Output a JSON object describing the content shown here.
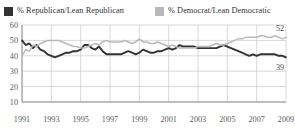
{
  "legend": {
    "position": "top",
    "entries": [
      {
        "key": "republican",
        "label": "% Republican/Lean Republican",
        "color": "#333333"
      },
      {
        "key": "democratic",
        "label": "% Democrat/Lean Democratic",
        "color": "#b9b9b9"
      }
    ]
  },
  "axis": {
    "y_ticks": [
      "60",
      "50",
      "40",
      "30",
      "20",
      "10"
    ],
    "x_ticks": [
      "1991",
      "1993",
      "1995",
      "1997",
      "1999",
      "2001",
      "2003",
      "2005",
      "2007",
      "2009"
    ]
  },
  "end_labels": {
    "democratic": "52",
    "republican": "39"
  },
  "chart_data": {
    "type": "line",
    "title": "",
    "subtitle": "",
    "xlabel": "",
    "ylabel": "",
    "xlim": [
      1991,
      2009
    ],
    "ylim": [
      10,
      60
    ],
    "yticks": [
      10,
      20,
      30,
      40,
      50,
      60
    ],
    "xticks": [
      1991,
      1993,
      1995,
      1997,
      1999,
      2001,
      2003,
      2005,
      2007,
      2009
    ],
    "grid": true,
    "legend_position": "top",
    "annotations": [
      {
        "series": "% Democrat/Lean Democratic",
        "x": 2009,
        "y": 52,
        "text": "52"
      },
      {
        "series": "% Republican/Lean Republican",
        "x": 2009,
        "y": 39,
        "text": "39"
      }
    ],
    "x": [
      1991,
      1991.25,
      1991.5,
      1991.75,
      1992,
      1992.25,
      1992.5,
      1992.75,
      1993,
      1993.25,
      1993.5,
      1993.75,
      1994,
      1994.25,
      1994.5,
      1994.75,
      1995,
      1995.25,
      1995.5,
      1995.75,
      1996,
      1996.25,
      1996.5,
      1996.75,
      1997,
      1997.25,
      1997.5,
      1997.75,
      1998,
      1998.25,
      1998.5,
      1998.75,
      1999,
      1999.25,
      1999.5,
      1999.75,
      2000,
      2000.25,
      2000.5,
      2000.75,
      2001,
      2001.25,
      2001.5,
      2001.75,
      2002,
      2002.25,
      2002.5,
      2002.75,
      2003,
      2003.25,
      2003.5,
      2003.75,
      2004,
      2004.25,
      2004.5,
      2004.75,
      2005,
      2005.25,
      2005.5,
      2005.75,
      2006,
      2006.25,
      2006.5,
      2006.75,
      2007,
      2007.25,
      2007.5,
      2007.75,
      2008,
      2008.25,
      2008.5,
      2008.75,
      2009
    ],
    "series": [
      {
        "name": "% Republican/Lean Republican",
        "color": "#333333",
        "values": [
          50,
          47,
          48,
          45,
          47,
          44,
          43,
          41,
          40,
          39,
          40,
          41,
          42,
          42,
          43,
          43,
          44,
          47,
          47,
          45,
          44,
          46,
          43,
          41,
          41,
          41,
          41,
          41,
          42,
          43,
          42,
          41,
          42,
          44,
          43,
          42,
          42,
          43,
          43,
          44,
          45,
          44,
          45,
          47,
          46,
          46,
          46,
          46,
          45,
          45,
          45,
          45,
          45,
          45,
          46,
          47,
          46,
          45,
          44,
          43,
          42,
          41,
          40,
          41,
          40,
          41,
          41,
          41,
          41,
          41,
          40,
          40,
          39
        ]
      },
      {
        "name": "% Democrat/Lean Democratic",
        "color": "#b9b9b9",
        "values": [
          40,
          44,
          43,
          47,
          46,
          48,
          49,
          50,
          50,
          50,
          50,
          49,
          48,
          47,
          46,
          46,
          45,
          45,
          46,
          47,
          48,
          47,
          49,
          50,
          49,
          49,
          49,
          49,
          50,
          49,
          48,
          49,
          51,
          49,
          49,
          48,
          48,
          49,
          48,
          47,
          46,
          47,
          46,
          45,
          45,
          45,
          45,
          45,
          46,
          46,
          46,
          46,
          47,
          48,
          47,
          47,
          48,
          49,
          50,
          51,
          51,
          52,
          52,
          52,
          52,
          53,
          53,
          52,
          52,
          53,
          52,
          51,
          52
        ]
      }
    ]
  }
}
